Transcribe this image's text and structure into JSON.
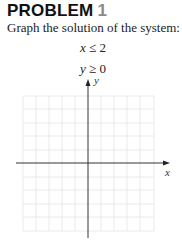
{
  "problem": {
    "heading": "PROBLEM",
    "number": "1",
    "instruction": "Graph the solution of the system:",
    "inequalities": [
      {
        "var": "x",
        "op": "≤",
        "value": "2"
      },
      {
        "var": "y",
        "op": "≥",
        "value": "0"
      }
    ]
  },
  "graph": {
    "x_axis_label": "x",
    "y_axis_label": "y",
    "grid_cells_x": 10,
    "grid_cells_y": 10,
    "shaded_region": "none"
  }
}
